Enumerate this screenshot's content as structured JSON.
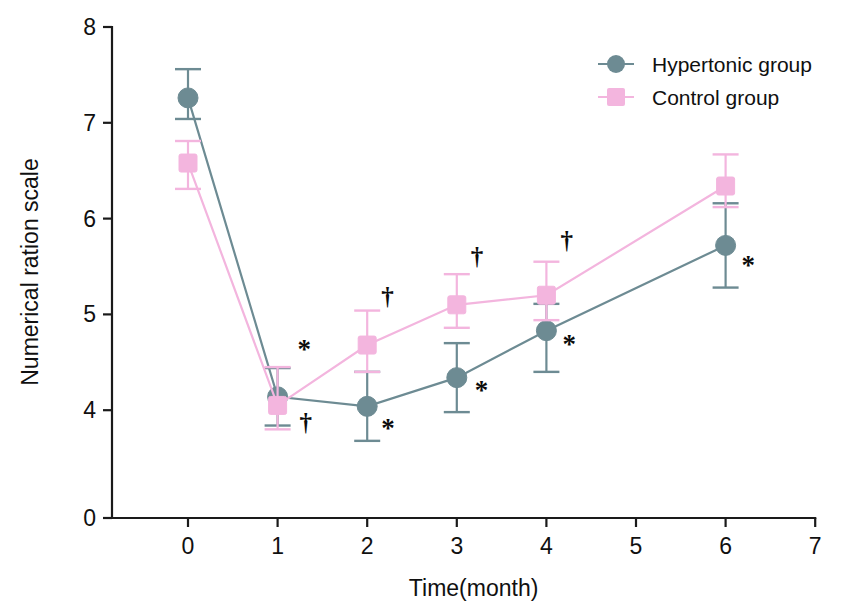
{
  "chart_data": {
    "type": "line",
    "title": "",
    "xlabel": "Time(month)",
    "ylabel": "Numerical ration scale",
    "x": [
      0,
      1,
      2,
      3,
      4,
      6
    ],
    "xticks": [
      0,
      1,
      2,
      3,
      4,
      5,
      6,
      7
    ],
    "xticklabels": [
      "0",
      "1",
      "2",
      "3",
      "4",
      "5",
      "6",
      "7"
    ],
    "xlim": [
      -0.2,
      7.0
    ],
    "yticks": [
      0,
      4,
      5,
      6,
      7,
      8
    ],
    "yticklabels": [
      "0",
      "4",
      "5",
      "6",
      "7",
      "8"
    ],
    "ylim": [
      0,
      8
    ],
    "y_axis_break": true,
    "grid": false,
    "legend_position": "top-right",
    "series": [
      {
        "name": "Hypertonic group",
        "marker": "circle",
        "color": "#6d8b93",
        "values": [
          7.26,
          4.14,
          4.04,
          4.34,
          4.83,
          5.72
        ],
        "err_upper": [
          0.3,
          0.3,
          0.36,
          0.36,
          0.28,
          0.44
        ],
        "err_lower": [
          0.22,
          0.3,
          0.36,
          0.36,
          0.43,
          0.44
        ]
      },
      {
        "name": "Control group",
        "marker": "square",
        "color": "#f3b5de",
        "values": [
          6.58,
          4.05,
          4.68,
          5.1,
          5.2,
          6.34
        ],
        "err_upper": [
          0.23,
          0.4,
          0.36,
          0.32,
          0.35,
          0.33
        ],
        "err_lower": [
          0.27,
          0.25,
          0.28,
          0.24,
          0.26,
          0.22
        ]
      }
    ],
    "annotations": [
      {
        "symbol": "*",
        "x": 1,
        "y": 4.55,
        "dx": 20,
        "note": "significance-marker"
      },
      {
        "symbol": "†",
        "x": 1,
        "y": 3.78,
        "dx": 22,
        "note": "significance-marker"
      },
      {
        "symbol": "†",
        "x": 2,
        "y": 5.1,
        "dx": 14,
        "note": "significance-marker"
      },
      {
        "symbol": "*",
        "x": 2,
        "y": 3.72,
        "dx": 14,
        "note": "significance-marker"
      },
      {
        "symbol": "†",
        "x": 3,
        "y": 5.52,
        "dx": 14,
        "note": "significance-marker"
      },
      {
        "symbol": "*",
        "x": 3,
        "y": 4.12,
        "dx": 18,
        "note": "significance-marker"
      },
      {
        "symbol": "†",
        "x": 4,
        "y": 5.68,
        "dx": 14,
        "note": "significance-marker"
      },
      {
        "symbol": "*",
        "x": 4,
        "y": 4.6,
        "dx": 16,
        "note": "significance-marker"
      },
      {
        "symbol": "*",
        "x": 6,
        "y": 5.42,
        "dx": 16,
        "note": "significance-marker"
      }
    ],
    "legend": [
      {
        "label": "Hypertonic group",
        "color": "#6d8b93",
        "marker": "circle"
      },
      {
        "label": "Control group",
        "color": "#f3b5de",
        "marker": "square"
      }
    ]
  }
}
